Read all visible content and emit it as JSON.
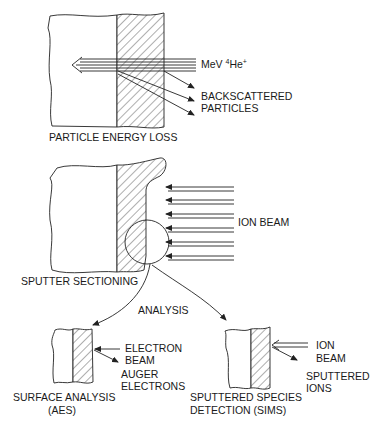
{
  "diagram": {
    "type": "process-schematic",
    "panels": {
      "particle_energy_loss": {
        "title": "PARTICLE ENERGY LOSS",
        "beam_label": "MeV ",
        "beam_isotope_mass": "4",
        "beam_species": "He",
        "beam_charge": "+",
        "scatter_label_line1": "BACKSCATTERED",
        "scatter_label_line2": "PARTICLES"
      },
      "sputter_sectioning": {
        "title": "SPUTTER SECTIONING",
        "beam_label": "ION BEAM",
        "beam_arrow_count": 6
      },
      "analysis": {
        "label": "ANALYSIS"
      },
      "surface_analysis": {
        "title_line1": "SURFACE ANALYSIS",
        "title_line2": "(AES)",
        "incident_label_line1": "ELECTRON",
        "incident_label_line2": "BEAM",
        "emitted_label_line1": "AUGER",
        "emitted_label_line2": "ELECTRONS"
      },
      "sims": {
        "title_line1": "SPUTTERED SPECIES",
        "title_line2": "DETECTION (SIMS)",
        "incident_label_line1": "ION",
        "incident_label_line2": "BEAM",
        "emitted_label_line1": "SPUTTERED",
        "emitted_label_line2": "IONS"
      }
    },
    "colors": {
      "line": "#222222",
      "background": "#ffffff"
    }
  }
}
